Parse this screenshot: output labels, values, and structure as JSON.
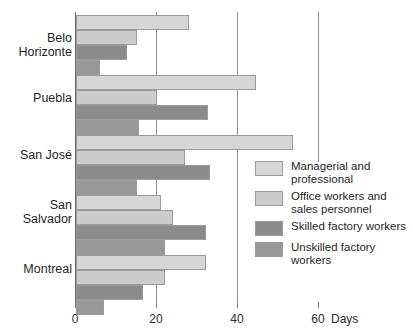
{
  "chart_data": {
    "type": "bar",
    "orientation": "horizontal",
    "title": "",
    "subtitle": "",
    "xlabel": "Days",
    "ylabel": "",
    "xlim": [
      0,
      60
    ],
    "xticks": [
      0,
      20,
      40,
      60
    ],
    "xtick_labels": [
      "0",
      "20",
      "40",
      "60"
    ],
    "axis_unit_label": "Days",
    "grid": true,
    "grid_axis": "x",
    "legend_position": "right-middle",
    "categories": [
      "Belo\nHorizonte",
      "Puebla",
      "San José",
      "San\nSalvador",
      "Montreal"
    ],
    "series": [
      {
        "name": "Managerial and\nprofessional",
        "color": "#d6d6d6",
        "values": [
          28,
          44.5,
          53.5,
          21,
          32
        ]
      },
      {
        "name": "Office workers and\nsales personnel",
        "color": "#cccccc",
        "values": [
          15,
          20,
          27,
          24,
          22
        ]
      },
      {
        "name": "Skilled factory workers",
        "color": "#8b8b8b",
        "values": [
          12.5,
          32.5,
          33,
          32,
          16.5
        ]
      },
      {
        "name": "Unskilled factory\nworkers",
        "color": "#989898",
        "values": [
          6,
          15.5,
          15,
          22,
          7
        ]
      }
    ]
  },
  "legend": {
    "items": [
      {
        "label": "Managerial and\nprofessional",
        "color": "#d6d6d6"
      },
      {
        "label": "Office workers and\nsales personnel",
        "color": "#cccccc"
      },
      {
        "label": "Skilled factory workers",
        "color": "#8b8b8b"
      },
      {
        "label": "Unskilled factory\nworkers",
        "color": "#989898"
      }
    ]
  },
  "axis": {
    "unit": "Days",
    "ticks": [
      "0",
      "20",
      "40",
      "60"
    ]
  }
}
